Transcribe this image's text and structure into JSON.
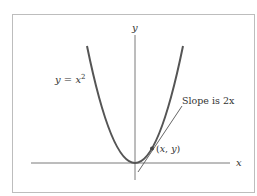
{
  "figure": {
    "axes": {
      "x_label": "x",
      "y_label": "y"
    },
    "curve": {
      "label_lhs": "y",
      "label_eq": " = ",
      "label_rhs": "x",
      "label_exp": "2",
      "equation": "y = x^2"
    },
    "tangent": {
      "label_text": "Slope is ",
      "label_math": "2x"
    },
    "point": {
      "label_open": "(",
      "label_x": "x",
      "label_sep": ", ",
      "label_y": "y",
      "label_close": ")"
    },
    "colors": {
      "curve": "#5a5a5a",
      "axis": "#7a7a7a",
      "frame": "#bbbbbb",
      "text": "#333333"
    }
  }
}
